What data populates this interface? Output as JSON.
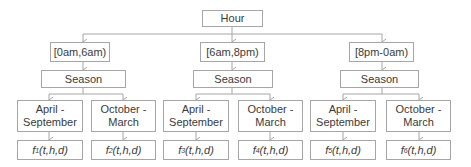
{
  "diagram": {
    "root": {
      "label": "Hour"
    },
    "hour_ranges": [
      {
        "label": "[0am,6am)"
      },
      {
        "label": "[6am,8pm)"
      },
      {
        "label": "[8pm-0am)"
      }
    ],
    "season_label": "Season",
    "seasons": [
      {
        "label_line1": "April -",
        "label_line2": "September"
      },
      {
        "label_line1": "October -",
        "label_line2": "March"
      }
    ],
    "functions": [
      {
        "name": "f",
        "sub": "1",
        "args": "(t,h,d)"
      },
      {
        "name": "f",
        "sub": "2",
        "args": "(t,h,d)"
      },
      {
        "name": "f",
        "sub": "3",
        "args": "(t,h,d)"
      },
      {
        "name": "f",
        "sub": "4",
        "args": "(t,h,d)"
      },
      {
        "name": "f",
        "sub": "5",
        "args": "(t,h,d)"
      },
      {
        "name": "f",
        "sub": "6",
        "args": "(t,h,d)"
      }
    ],
    "colors": {
      "border": "#a6a6a6",
      "connector": "#a6a6a6",
      "text": "#3a3a3a"
    }
  }
}
